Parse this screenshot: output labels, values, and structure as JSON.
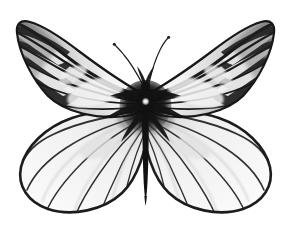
{
  "image": {
    "subject": "butterfly-specimen",
    "common_name": "Black-veined white butterfly specimen",
    "view": "dorsal, wings spread, pinned specimen",
    "medium": "black-and-white photograph",
    "background_color": "#ffffff",
    "ink_color": "#111111",
    "midtone_color": "#8c8c8c",
    "wing_membrane_color": "#efefef",
    "canvas": {
      "width": 291,
      "height": 230
    }
  },
  "caption": {
    "text": "",
    "visible": false
  },
  "anatomy": {
    "parts": [
      {
        "name": "left-forewing",
        "label": "Left forewing",
        "pattern": "pale membrane with dark radiating veins and heavy dark banding toward the outer margin"
      },
      {
        "name": "right-forewing",
        "label": "Right forewing",
        "pattern": "mirror of left forewing; dark veins and marginal barring"
      },
      {
        "name": "left-hindwing",
        "label": "Left hindwing",
        "pattern": "rounded, pale, thin dark veins radiating from base, dark outline"
      },
      {
        "name": "right-hindwing",
        "label": "Right hindwing",
        "pattern": "mirror of left hindwing"
      },
      {
        "name": "thorax",
        "label": "Thorax",
        "pattern": "dense black scaling with a small pale central highlight"
      },
      {
        "name": "abdomen",
        "label": "Abdomen",
        "pattern": "slender dark tapering body extending below the hindwings"
      },
      {
        "name": "left-antenna",
        "label": "Left antenna",
        "pattern": "thin curved filament with a small clubbed tip"
      },
      {
        "name": "right-antenna",
        "label": "Right antenna",
        "pattern": "thin curved filament with a small clubbed tip"
      }
    ],
    "vein_counts": {
      "forewing_veins": 9,
      "hindwing_veins": 9
    }
  }
}
